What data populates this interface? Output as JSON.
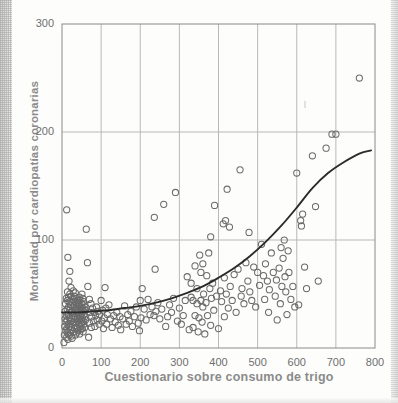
{
  "figure": {
    "kind": "scatter-plot-with-fitted-curve",
    "background_color": "#fdfdfb",
    "scan_edge": "dithered-gray-scanned-page-margin"
  },
  "chart_data": {
    "type": "scatter",
    "title": "",
    "xlabel": "Cuestionario sobre consumo de trigo",
    "ylabel": "Mortalidad por cardiopatías coronarias",
    "xlim": [
      0,
      800
    ],
    "ylim": [
      0,
      300
    ],
    "xticks": [
      0,
      100,
      200,
      300,
      400,
      500,
      600,
      700,
      800
    ],
    "yticks": [
      0,
      100,
      200,
      300
    ],
    "grid": true,
    "grid_color": "#b9b9b9",
    "marker": "open-circle",
    "marker_color": "#6b6b6b",
    "legend": "none",
    "fit_curve": {
      "name": "curva ajustada",
      "color": "#2b2b2b",
      "shape": "exponential-increasing",
      "points": [
        [
          0,
          33
        ],
        [
          40,
          33
        ],
        [
          80,
          34
        ],
        [
          120,
          35
        ],
        [
          160,
          37
        ],
        [
          200,
          39
        ],
        [
          240,
          42
        ],
        [
          280,
          46
        ],
        [
          320,
          51
        ],
        [
          360,
          57
        ],
        [
          400,
          65
        ],
        [
          440,
          74
        ],
        [
          480,
          85
        ],
        [
          520,
          98
        ],
        [
          560,
          113
        ],
        [
          600,
          130
        ],
        [
          640,
          148
        ],
        [
          680,
          162
        ],
        [
          720,
          172
        ],
        [
          760,
          180
        ],
        [
          790,
          183
        ]
      ]
    },
    "points": [
      [
        5,
        5
      ],
      [
        6,
        12
      ],
      [
        7,
        20
      ],
      [
        8,
        27
      ],
      [
        8,
        34
      ],
      [
        9,
        41
      ],
      [
        10,
        16
      ],
      [
        10,
        24
      ],
      [
        11,
        30
      ],
      [
        11,
        46
      ],
      [
        12,
        10
      ],
      [
        12,
        18
      ],
      [
        13,
        26
      ],
      [
        13,
        36
      ],
      [
        14,
        44
      ],
      [
        14,
        52
      ],
      [
        15,
        8
      ],
      [
        15,
        14
      ],
      [
        16,
        22
      ],
      [
        16,
        31
      ],
      [
        17,
        38
      ],
      [
        17,
        47
      ],
      [
        18,
        12
      ],
      [
        18,
        20
      ],
      [
        19,
        28
      ],
      [
        19,
        35
      ],
      [
        20,
        43
      ],
      [
        20,
        50
      ],
      [
        21,
        17
      ],
      [
        21,
        25
      ],
      [
        22,
        33
      ],
      [
        22,
        40
      ],
      [
        23,
        48
      ],
      [
        23,
        56
      ],
      [
        24,
        11
      ],
      [
        24,
        19
      ],
      [
        25,
        27
      ],
      [
        25,
        34
      ],
      [
        26,
        42
      ],
      [
        26,
        9
      ],
      [
        12,
        128
      ],
      [
        15,
        84
      ],
      [
        18,
        62
      ],
      [
        20,
        71
      ],
      [
        27,
        22
      ],
      [
        27,
        30
      ],
      [
        28,
        38
      ],
      [
        28,
        45
      ],
      [
        29,
        15
      ],
      [
        29,
        53
      ],
      [
        30,
        24
      ],
      [
        30,
        32
      ],
      [
        31,
        40
      ],
      [
        31,
        48
      ],
      [
        32,
        18
      ],
      [
        32,
        27
      ],
      [
        33,
        35
      ],
      [
        33,
        43
      ],
      [
        34,
        12
      ],
      [
        34,
        51
      ],
      [
        35,
        21
      ],
      [
        35,
        29
      ],
      [
        36,
        37
      ],
      [
        36,
        46
      ],
      [
        37,
        14
      ],
      [
        37,
        24
      ],
      [
        38,
        33
      ],
      [
        38,
        41
      ],
      [
        39,
        19
      ],
      [
        39,
        28
      ],
      [
        40,
        36
      ],
      [
        40,
        44
      ],
      [
        41,
        16
      ],
      [
        41,
        25
      ],
      [
        42,
        34
      ],
      [
        42,
        42
      ],
      [
        43,
        22
      ],
      [
        43,
        30
      ],
      [
        44,
        39
      ],
      [
        44,
        47
      ],
      [
        45,
        13
      ],
      [
        45,
        27
      ],
      [
        46,
        35
      ],
      [
        46,
        44
      ],
      [
        47,
        20
      ],
      [
        47,
        29
      ],
      [
        48,
        38
      ],
      [
        48,
        17
      ],
      [
        49,
        26
      ],
      [
        49,
        35
      ],
      [
        50,
        23
      ],
      [
        50,
        32
      ],
      [
        51,
        41
      ],
      [
        51,
        50
      ],
      [
        52,
        18
      ],
      [
        52,
        28
      ],
      [
        53,
        37
      ],
      [
        53,
        46
      ],
      [
        54,
        15
      ],
      [
        54,
        25
      ],
      [
        55,
        34
      ],
      [
        55,
        43
      ],
      [
        56,
        22
      ],
      [
        56,
        31
      ],
      [
        57,
        40
      ],
      [
        58,
        19
      ],
      [
        58,
        29
      ],
      [
        59,
        38
      ],
      [
        60,
        26
      ],
      [
        60,
        35
      ],
      [
        62,
        110
      ],
      [
        65,
        79
      ],
      [
        66,
        57
      ],
      [
        68,
        10
      ],
      [
        70,
        45
      ],
      [
        70,
        23
      ],
      [
        72,
        33
      ],
      [
        74,
        41
      ],
      [
        75,
        19
      ],
      [
        76,
        29
      ],
      [
        78,
        37
      ],
      [
        80,
        25
      ],
      [
        82,
        33
      ],
      [
        84,
        20
      ],
      [
        86,
        30
      ],
      [
        88,
        38
      ],
      [
        90,
        26
      ],
      [
        92,
        34
      ],
      [
        95,
        22
      ],
      [
        96,
        31
      ],
      [
        100,
        44
      ],
      [
        102,
        25
      ],
      [
        104,
        35
      ],
      [
        106,
        18
      ],
      [
        108,
        28
      ],
      [
        110,
        56
      ],
      [
        112,
        37
      ],
      [
        114,
        22
      ],
      [
        116,
        31
      ],
      [
        120,
        40
      ],
      [
        124,
        27
      ],
      [
        128,
        19
      ],
      [
        132,
        30
      ],
      [
        136,
        24
      ],
      [
        140,
        33
      ],
      [
        144,
        21
      ],
      [
        148,
        29
      ],
      [
        150,
        17
      ],
      [
        155,
        27
      ],
      [
        160,
        39
      ],
      [
        164,
        22
      ],
      [
        168,
        31
      ],
      [
        172,
        25
      ],
      [
        176,
        34
      ],
      [
        180,
        20
      ],
      [
        185,
        29
      ],
      [
        190,
        38
      ],
      [
        195,
        23
      ],
      [
        198,
        16
      ],
      [
        200,
        44
      ],
      [
        202,
        28
      ],
      [
        205,
        55
      ],
      [
        210,
        36
      ],
      [
        215,
        26
      ],
      [
        220,
        45
      ],
      [
        225,
        31
      ],
      [
        230,
        38
      ],
      [
        235,
        30
      ],
      [
        236,
        121
      ],
      [
        238,
        73
      ],
      [
        240,
        34
      ],
      [
        245,
        42
      ],
      [
        250,
        27
      ],
      [
        255,
        36
      ],
      [
        260,
        133
      ],
      [
        265,
        20
      ],
      [
        270,
        29
      ],
      [
        275,
        40
      ],
      [
        280,
        33
      ],
      [
        285,
        46
      ],
      [
        290,
        144
      ],
      [
        295,
        25
      ],
      [
        300,
        37
      ],
      [
        305,
        22
      ],
      [
        310,
        30
      ],
      [
        315,
        44
      ],
      [
        320,
        66
      ],
      [
        325,
        17
      ],
      [
        330,
        47
      ],
      [
        330,
        60
      ],
      [
        335,
        44
      ],
      [
        335,
        19
      ],
      [
        340,
        30
      ],
      [
        340,
        76
      ],
      [
        345,
        41
      ],
      [
        345,
        55
      ],
      [
        348,
        15
      ],
      [
        350,
        28
      ],
      [
        352,
        86
      ],
      [
        355,
        44
      ],
      [
        355,
        70
      ],
      [
        358,
        24
      ],
      [
        360,
        38
      ],
      [
        360,
        78
      ],
      [
        362,
        50
      ],
      [
        365,
        13
      ],
      [
        368,
        42
      ],
      [
        370,
        67
      ],
      [
        372,
        30
      ],
      [
        375,
        88
      ],
      [
        378,
        55
      ],
      [
        380,
        103
      ],
      [
        380,
        21
      ],
      [
        382,
        46
      ],
      [
        385,
        60
      ],
      [
        388,
        35
      ],
      [
        390,
        132
      ],
      [
        395,
        48
      ],
      [
        400,
        18
      ],
      [
        405,
        53
      ],
      [
        408,
        43
      ],
      [
        412,
        115
      ],
      [
        415,
        65
      ],
      [
        415,
        29
      ],
      [
        418,
        118
      ],
      [
        420,
        50
      ],
      [
        422,
        147
      ],
      [
        425,
        37
      ],
      [
        428,
        112
      ],
      [
        430,
        57
      ],
      [
        435,
        44
      ],
      [
        440,
        68
      ],
      [
        445,
        33
      ],
      [
        450,
        73
      ],
      [
        455,
        165
      ],
      [
        458,
        48
      ],
      [
        460,
        55
      ],
      [
        465,
        41
      ],
      [
        470,
        79
      ],
      [
        475,
        62
      ],
      [
        478,
        107
      ],
      [
        480,
        52
      ],
      [
        485,
        44
      ],
      [
        490,
        75
      ],
      [
        495,
        38
      ],
      [
        500,
        70
      ],
      [
        505,
        58
      ],
      [
        510,
        96
      ],
      [
        515,
        67
      ],
      [
        518,
        45
      ],
      [
        520,
        78
      ],
      [
        525,
        62
      ],
      [
        528,
        33
      ],
      [
        530,
        54
      ],
      [
        535,
        88
      ],
      [
        540,
        70
      ],
      [
        545,
        48
      ],
      [
        548,
        63
      ],
      [
        550,
        26
      ],
      [
        555,
        74
      ],
      [
        558,
        41
      ],
      [
        560,
        93
      ],
      [
        562,
        57
      ],
      [
        565,
        83
      ],
      [
        568,
        100
      ],
      [
        570,
        66
      ],
      [
        572,
        52
      ],
      [
        575,
        31
      ],
      [
        578,
        90
      ],
      [
        580,
        70
      ],
      [
        585,
        45
      ],
      [
        590,
        57
      ],
      [
        595,
        38
      ],
      [
        600,
        162
      ],
      [
        605,
        40
      ],
      [
        610,
        118
      ],
      [
        612,
        113
      ],
      [
        615,
        124
      ],
      [
        620,
        75
      ],
      [
        625,
        55
      ],
      [
        640,
        178
      ],
      [
        648,
        131
      ],
      [
        655,
        62
      ],
      [
        675,
        185
      ],
      [
        690,
        198
      ],
      [
        700,
        198
      ],
      [
        760,
        250
      ]
    ]
  },
  "axes": {
    "y_title": "Mortalidad por cardiopatías coronarias",
    "x_title": "Cuestionario sobre consumo de trigo",
    "y_labels": [
      "300",
      "200",
      "100",
      "0"
    ],
    "x_labels": [
      "0",
      "100",
      "200",
      "300",
      "400",
      "500",
      "600",
      "700",
      "800"
    ]
  },
  "colors": {
    "marker": "#6b6b6b",
    "curve": "#2b2b2b",
    "grid": "#b9b9b9",
    "frame": "#8a8a8a",
    "title_text": "#8b8b8b",
    "tick_text": "#6f6f6f",
    "background": "#fdfdfb"
  }
}
